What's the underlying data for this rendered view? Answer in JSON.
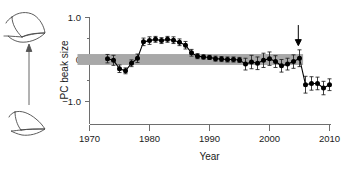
{
  "chart_data": {
    "type": "line",
    "title": "",
    "subtitle": "",
    "xlabel": "Year",
    "ylabel": "PC beak size",
    "xlim": [
      1968,
      2011.5
    ],
    "ylim": [
      -1.35,
      1.15
    ],
    "xticks": [
      1970,
      1980,
      1990,
      2000,
      2010
    ],
    "xtick_labels": [
      "1970",
      "1980",
      "1990",
      "2000",
      "2010"
    ],
    "yticks": [
      1.0,
      0,
      -1.0
    ],
    "ytick_labels": [
      "1.0",
      "0",
      "−1.0"
    ],
    "yminorticks": [
      0.5,
      -0.5
    ],
    "grid": false,
    "legend": null,
    "reference_band": {
      "label": "baseline reference band",
      "ymin": -0.13,
      "ymax": 0.13,
      "xmin": 1968,
      "xmax": 2005.6,
      "color": "#a8a8a8"
    },
    "annotations": [
      {
        "name": "event-arrow",
        "type": "down-arrow",
        "x": 2004.8,
        "y_top": 0.82,
        "y_bottom": 0.33,
        "label": ""
      }
    ],
    "series": [
      {
        "name": "PC beak size",
        "marker": "filled-circle",
        "color": "#000000",
        "error_type": "95% CI",
        "x": [
          1973,
          1974,
          1975,
          1976,
          1977,
          1978,
          1979,
          1980,
          1981,
          1982,
          1983,
          1984,
          1985,
          1986,
          1987,
          1988,
          1989,
          1990,
          1991,
          1992,
          1993,
          1994,
          1995,
          1996,
          1997,
          1998,
          1999,
          2000,
          2001,
          2002,
          2003,
          2004,
          2005,
          2006,
          2007,
          2008,
          2009,
          2010
        ],
        "values": [
          0.02,
          -0.02,
          -0.22,
          -0.27,
          -0.09,
          0.03,
          0.42,
          0.45,
          0.48,
          0.45,
          0.48,
          0.46,
          0.41,
          0.34,
          0.16,
          0.08,
          0.06,
          0.05,
          0.02,
          0.01,
          0.0,
          0.0,
          -0.01,
          -0.11,
          -0.06,
          -0.09,
          -0.02,
          0.02,
          -0.05,
          -0.15,
          -0.11,
          -0.05,
          0.03,
          -0.6,
          -0.57,
          -0.57,
          -0.68,
          -0.6
        ],
        "yerr": [
          0.1,
          0.12,
          0.09,
          0.07,
          0.08,
          0.1,
          0.09,
          0.09,
          0.07,
          0.07,
          0.07,
          0.08,
          0.08,
          0.09,
          0.08,
          0.06,
          0.05,
          0.05,
          0.06,
          0.06,
          0.06,
          0.06,
          0.06,
          0.14,
          0.16,
          0.15,
          0.17,
          0.16,
          0.14,
          0.15,
          0.14,
          0.16,
          0.2,
          0.2,
          0.16,
          0.15,
          0.16,
          0.14
        ]
      }
    ]
  },
  "side_panel": {
    "top_illustration": "large-deep-beak-icon",
    "bottom_illustration": "small-pointed-beak-icon",
    "direction_arrow": "up-arrow-icon"
  },
  "axes": {
    "x_title": "Year",
    "y_title": "PC beak size"
  }
}
